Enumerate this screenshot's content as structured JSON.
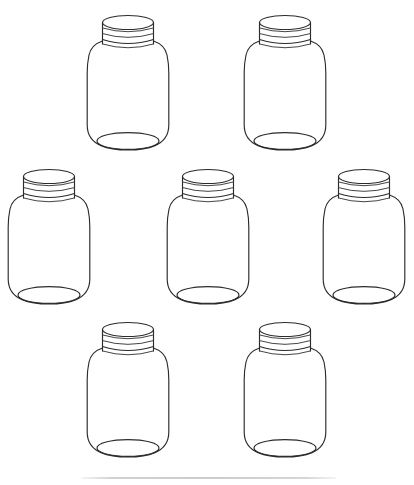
{
  "page": {
    "background_color": "#ffffff",
    "width": 414,
    "height": 485,
    "style": "line-art-outline",
    "jar_count": 7,
    "row_layout": [
      2,
      3,
      2
    ]
  },
  "artwork": {
    "stroke_color": "#2b2b2b",
    "secondary_stroke_color": "#3a3a3a",
    "fill_color": "none",
    "stroke_width": 1.15,
    "description": "Seven identical empty glass mason jars with screw-on lids, drawn as uncolored outlines"
  },
  "jars": [
    {
      "id": "jar-1",
      "label": "Jar 1",
      "row": 1,
      "column": 1,
      "cx": 128,
      "top": 13,
      "width": 86,
      "height": 138
    },
    {
      "id": "jar-2",
      "label": "Jar 2",
      "row": 1,
      "column": 2,
      "cx": 285,
      "top": 13,
      "width": 86,
      "height": 138
    },
    {
      "id": "jar-3",
      "label": "Jar 3",
      "row": 2,
      "column": 1,
      "cx": 49,
      "top": 167,
      "width": 86,
      "height": 138
    },
    {
      "id": "jar-4",
      "label": "Jar 4",
      "row": 2,
      "column": 2,
      "cx": 208,
      "top": 167,
      "width": 86,
      "height": 138
    },
    {
      "id": "jar-5",
      "label": "Jar 5",
      "row": 2,
      "column": 3,
      "cx": 364,
      "top": 167,
      "width": 86,
      "height": 138
    },
    {
      "id": "jar-6",
      "label": "Jar 6",
      "row": 3,
      "column": 1,
      "cx": 128,
      "top": 320,
      "width": 86,
      "height": 138
    },
    {
      "id": "jar-7",
      "label": "Jar 7",
      "row": 3,
      "column": 2,
      "cx": 285,
      "top": 320,
      "width": 86,
      "height": 138
    }
  ],
  "jar_parts": [
    {
      "name": "lid-top-ellipse",
      "label": "Lid top"
    },
    {
      "name": "lid-band",
      "label": "Lid band"
    },
    {
      "name": "lid-rib-line",
      "label": "Lid rib"
    },
    {
      "name": "jar-neck",
      "label": "Neck"
    },
    {
      "name": "jar-shoulder",
      "label": "Shoulder"
    },
    {
      "name": "jar-body",
      "label": "Body"
    },
    {
      "name": "jar-base-ellipse",
      "label": "Base"
    }
  ],
  "footer_rule": {
    "label": "Horizontal divider rule",
    "x": 82,
    "y": 477,
    "width": 254,
    "color": "#c9c9c9"
  }
}
